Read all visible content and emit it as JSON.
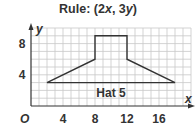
{
  "title": {
    "prefix": "Rule: (2",
    "x_var": "x",
    "middle": ", 3",
    "y_var": "y",
    "suffix": ")"
  },
  "axes": {
    "x_label": "x",
    "y_label": "y",
    "origin_label": "O",
    "x_ticks": [
      "4",
      "8",
      "12",
      "16"
    ],
    "y_ticks": [
      "4",
      "8"
    ]
  },
  "figure_label": "Hat 5",
  "colors": {
    "shape_stroke": "#333333",
    "grid": "#c8c8c8",
    "axis": "#333333",
    "text": "#333333"
  },
  "diagram_data": {
    "type": "coordinate-grid-figure",
    "grid": {
      "x_range": [
        0,
        20
      ],
      "y_range": [
        0,
        10
      ],
      "step": 1
    },
    "shape_vertices": [
      [
        2,
        3
      ],
      [
        8,
        6
      ],
      [
        8,
        9
      ],
      [
        12,
        9
      ],
      [
        12,
        6
      ],
      [
        18,
        3
      ]
    ],
    "closed": true,
    "transformation_rule": "(2x, 3y)"
  }
}
